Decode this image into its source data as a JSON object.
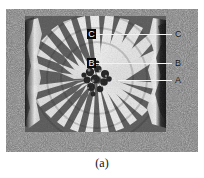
{
  "figure": {
    "caption": "(a)",
    "type": "grayscale-interference-micrograph"
  },
  "annotations": {
    "left_labels": [
      {
        "id": "C",
        "text": "C"
      },
      {
        "id": "B",
        "text": "B"
      },
      {
        "id": "A",
        "text": "A"
      }
    ],
    "right_labels": [
      {
        "id": "C",
        "text": "C"
      },
      {
        "id": "B",
        "text": "B"
      },
      {
        "id": "A",
        "text": "A"
      }
    ]
  },
  "colors": {
    "frame_gray": "#6f6f6f",
    "fringe_light": "#ffffff",
    "fringe_dark": "#2a2a2a",
    "label_box": "#0a0a0a",
    "label_text": "#ffffff",
    "leader_line": "#f2f2f2",
    "caption_text": "#111111",
    "page_background": "#ffffff"
  }
}
